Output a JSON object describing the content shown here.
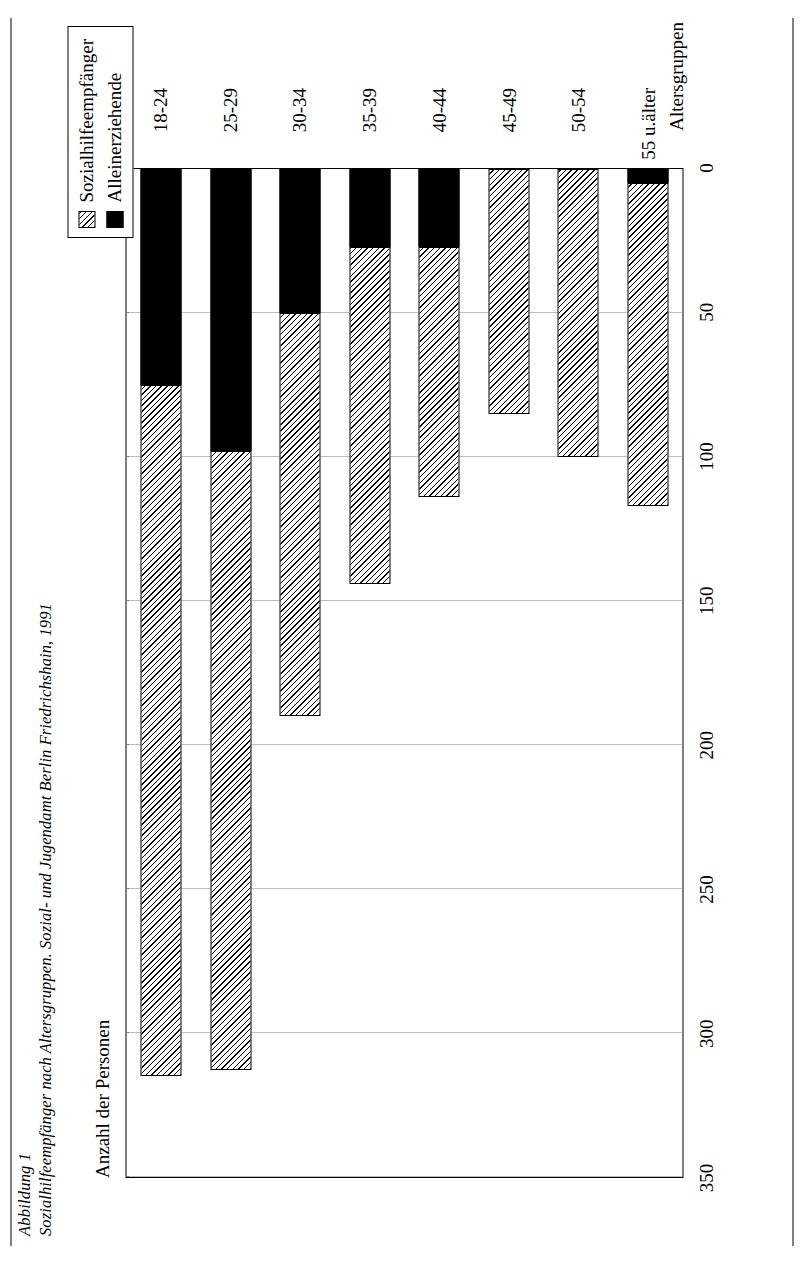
{
  "figure": {
    "number": "Abbildung 1",
    "caption": "Sozialhilfeempfänger nach Altersgruppen. Sozial- und Jugendamt Berlin Friedrichshain, 1991"
  },
  "legend": {
    "items": [
      {
        "label": "Sozialhilfeempfänger",
        "swatch": "hatched",
        "color": "#ffffff"
      },
      {
        "label": "Alleinerziehende",
        "swatch": "solid",
        "color": "#000000"
      }
    ]
  },
  "axes": {
    "ylabel": "Anzahl der Personen",
    "xlabel": "Altersgruppen"
  },
  "chart_data": {
    "type": "bar",
    "orientation": "vertical",
    "stacked": true,
    "title": "Sozialhilfeempfänger nach Altersgruppen. Sozial- und Jugendamt Berlin Friedrichshain, 1991",
    "xlabel": "Altersgruppen",
    "ylabel": "Anzahl der Personen",
    "categories": [
      "18-24",
      "25-29",
      "30-34",
      "35-39",
      "40-44",
      "45-49",
      "50-54",
      "55 u.älter"
    ],
    "series": [
      {
        "name": "Sozialhilfeempfänger",
        "values": [
          240,
          215,
          140,
          117,
          87,
          85,
          100,
          112
        ]
      },
      {
        "name": "Alleinerziehende",
        "values": [
          75,
          98,
          50,
          27,
          27,
          0,
          0,
          5
        ]
      }
    ],
    "totals": [
      315,
      313,
      190,
      144,
      114,
      85,
      100,
      117
    ],
    "yticks": [
      0,
      50,
      100,
      150,
      200,
      250,
      300,
      350
    ],
    "ylim": [
      0,
      350
    ],
    "grid": "value-axis dotted",
    "legend_position": "top-right"
  }
}
